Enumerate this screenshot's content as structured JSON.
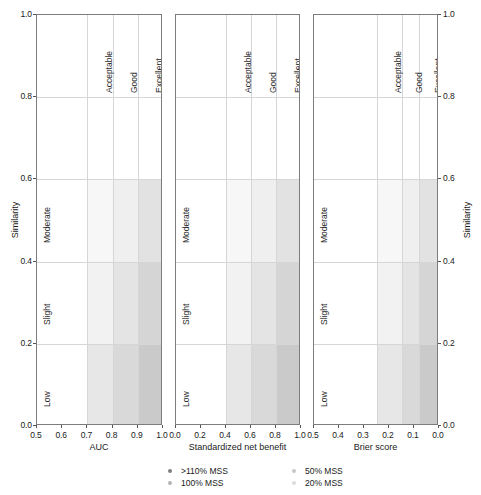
{
  "chart_data": {
    "type": "heatmap",
    "title": "",
    "subtitle": "",
    "layout": {
      "panels": 3,
      "grid": true,
      "legend_position": "bottom-center",
      "shared_y": true
    },
    "y": {
      "label_left": "Similarity",
      "label_right": "Similarity",
      "ticks": [
        0.0,
        0.2,
        0.4,
        0.6,
        0.8,
        1.0
      ],
      "ticklabels": [
        "0.0",
        "0.2",
        "0.4",
        "0.6",
        "0.8",
        "1.0"
      ],
      "ylim": [
        0.0,
        1.0
      ],
      "bands": [
        {
          "name": "Low",
          "from": 0.0,
          "to": 0.2
        },
        {
          "name": "Slight",
          "from": 0.2,
          "to": 0.4
        },
        {
          "name": "Moderate",
          "from": 0.4,
          "to": 0.6
        }
      ]
    },
    "performance_categories": [
      "Acceptable",
      "Good",
      "Excellent"
    ],
    "panels": [
      {
        "id": "auc",
        "xlabel": "AUC",
        "xlim": [
          0.5,
          1.0
        ],
        "reversed": false,
        "xticks": [
          0.5,
          0.6,
          0.7,
          0.8,
          0.9,
          1.0
        ],
        "xticklabels": [
          "0.5",
          "0.6",
          "0.7",
          "0.8",
          "0.9",
          "1.0"
        ],
        "category_bounds": [
          {
            "name": "Acceptable",
            "from": 0.7,
            "to": 0.8
          },
          {
            "name": "Good",
            "from": 0.8,
            "to": 0.9
          },
          {
            "name": "Excellent",
            "from": 0.9,
            "to": 1.0
          }
        ],
        "cells": [
          {
            "similarity": "Moderate",
            "category": "Acceptable",
            "shade": "#f7f7f7"
          },
          {
            "similarity": "Moderate",
            "category": "Good",
            "shade": "#efefef"
          },
          {
            "similarity": "Moderate",
            "category": "Excellent",
            "shade": "#e2e2e2"
          },
          {
            "similarity": "Slight",
            "category": "Acceptable",
            "shade": "#f2f2f2"
          },
          {
            "similarity": "Slight",
            "category": "Good",
            "shade": "#e4e4e4"
          },
          {
            "similarity": "Slight",
            "category": "Excellent",
            "shade": "#d5d5d5"
          },
          {
            "similarity": "Low",
            "category": "Acceptable",
            "shade": "#e7e7e7"
          },
          {
            "similarity": "Low",
            "category": "Good",
            "shade": "#d9d9d9"
          },
          {
            "similarity": "Low",
            "category": "Excellent",
            "shade": "#cacaca"
          }
        ]
      },
      {
        "id": "snb",
        "xlabel": "Standardized net benefit",
        "xlim": [
          0.0,
          1.0
        ],
        "reversed": false,
        "xticks": [
          0.0,
          0.2,
          0.4,
          0.6,
          0.8,
          1.0
        ],
        "xticklabels": [
          "0.0",
          "0.2",
          "0.4",
          "0.6",
          "0.8",
          "1.0"
        ],
        "category_bounds": [
          {
            "name": "Acceptable",
            "from": 0.4,
            "to": 0.6
          },
          {
            "name": "Good",
            "from": 0.6,
            "to": 0.8
          },
          {
            "name": "Excellent",
            "from": 0.8,
            "to": 1.0
          }
        ],
        "cells": [
          {
            "similarity": "Moderate",
            "category": "Acceptable",
            "shade": "#f7f7f7"
          },
          {
            "similarity": "Moderate",
            "category": "Good",
            "shade": "#efefef"
          },
          {
            "similarity": "Moderate",
            "category": "Excellent",
            "shade": "#e2e2e2"
          },
          {
            "similarity": "Slight",
            "category": "Acceptable",
            "shade": "#f2f2f2"
          },
          {
            "similarity": "Slight",
            "category": "Good",
            "shade": "#e4e4e4"
          },
          {
            "similarity": "Slight",
            "category": "Excellent",
            "shade": "#d5d5d5"
          },
          {
            "similarity": "Low",
            "category": "Acceptable",
            "shade": "#e7e7e7"
          },
          {
            "similarity": "Low",
            "category": "Good",
            "shade": "#d9d9d9"
          },
          {
            "similarity": "Low",
            "category": "Excellent",
            "shade": "#cacaca"
          }
        ]
      },
      {
        "id": "brier",
        "xlabel": "Brier score",
        "xlim": [
          0.5,
          0.0
        ],
        "reversed": true,
        "xticks": [
          0.5,
          0.4,
          0.3,
          0.2,
          0.1,
          0.0
        ],
        "xticklabels": [
          "0.5",
          "0.4",
          "0.3",
          "0.2",
          "0.1",
          "0.0"
        ],
        "category_bounds": [
          {
            "name": "Acceptable",
            "from": 0.25,
            "to": 0.15
          },
          {
            "name": "Good",
            "from": 0.15,
            "to": 0.08
          },
          {
            "name": "Excellent",
            "from": 0.08,
            "to": 0.0
          }
        ],
        "cells": [
          {
            "similarity": "Moderate",
            "category": "Acceptable",
            "shade": "#f7f7f7"
          },
          {
            "similarity": "Moderate",
            "category": "Good",
            "shade": "#efefef"
          },
          {
            "similarity": "Moderate",
            "category": "Excellent",
            "shade": "#e2e2e2"
          },
          {
            "similarity": "Slight",
            "category": "Acceptable",
            "shade": "#f2f2f2"
          },
          {
            "similarity": "Slight",
            "category": "Good",
            "shade": "#e4e4e4"
          },
          {
            "similarity": "Slight",
            "category": "Excellent",
            "shade": "#d5d5d5"
          },
          {
            "similarity": "Low",
            "category": "Acceptable",
            "shade": "#e7e7e7"
          },
          {
            "similarity": "Low",
            "category": "Good",
            "shade": "#d9d9d9"
          },
          {
            "similarity": "Low",
            "category": "Excellent",
            "shade": "#cacaca"
          }
        ]
      }
    ],
    "legend": {
      "entries": [
        {
          "label": ">110% MSS",
          "color": "#808080"
        },
        {
          "label": "50% MSS",
          "color": "#c8c8c8"
        },
        {
          "label": "100% MSS",
          "color": "#b4b4b4"
        },
        {
          "label": "20% MSS",
          "color": "#dcdcdc"
        }
      ]
    }
  }
}
